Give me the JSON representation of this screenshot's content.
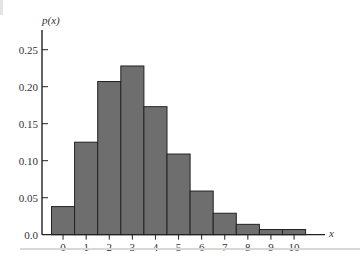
{
  "chart_data": {
    "type": "bar",
    "title": "",
    "xlabel": "x",
    "ylabel": "p(x)",
    "categories": [
      "0",
      "1",
      "2",
      "3",
      "4",
      "5",
      "6",
      "7",
      "8",
      "9",
      "10"
    ],
    "values": [
      0.038,
      0.125,
      0.207,
      0.228,
      0.173,
      0.109,
      0.059,
      0.029,
      0.014,
      0.007,
      0.007
    ],
    "ylim": [
      0,
      0.28
    ],
    "yticks": [
      0.0,
      0.05,
      0.1,
      0.15,
      0.2,
      0.25
    ],
    "ytick_labels": [
      "0.0",
      "0.05",
      "0.10",
      "0.15",
      "0.20",
      "0.25"
    ],
    "grid": false,
    "legend": null,
    "colors": {
      "bar_fill": "#6e6e6e",
      "bar_edge": "#222222",
      "axis": "#222222",
      "text": "#333333"
    }
  }
}
